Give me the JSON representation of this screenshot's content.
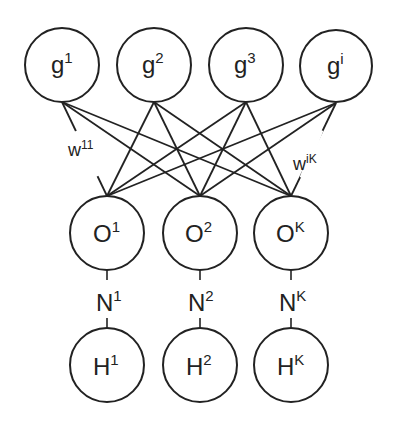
{
  "diagram": {
    "type": "network",
    "layers": {
      "g": [
        {
          "id": "g1",
          "base": "g",
          "sup": "1",
          "cx": 62,
          "cy": 65
        },
        {
          "id": "g2",
          "base": "g",
          "sup": "2",
          "cx": 154,
          "cy": 65
        },
        {
          "id": "g3",
          "base": "g",
          "sup": "3",
          "cx": 246,
          "cy": 65
        },
        {
          "id": "gi",
          "base": "g",
          "sup": "i",
          "cx": 336,
          "cy": 66
        }
      ],
      "O": [
        {
          "id": "O1",
          "base": "O",
          "sup": "1",
          "cx": 107,
          "cy": 233
        },
        {
          "id": "O2",
          "base": "O",
          "sup": "2",
          "cx": 200,
          "cy": 233
        },
        {
          "id": "OK",
          "base": "O",
          "sup": "K",
          "cx": 291,
          "cy": 233
        }
      ],
      "N": [
        {
          "id": "N1",
          "base": "N",
          "sup": "1"
        },
        {
          "id": "N2",
          "base": "N",
          "sup": "2"
        },
        {
          "id": "NK",
          "base": "N",
          "sup": "K"
        }
      ],
      "H": [
        {
          "id": "H1",
          "base": "H",
          "sup": "1",
          "cx": 107,
          "cy": 365
        },
        {
          "id": "H2",
          "base": "H",
          "sup": "2",
          "cx": 200,
          "cy": 365
        },
        {
          "id": "HK",
          "base": "H",
          "sup": "K",
          "cx": 291,
          "cy": 365
        }
      ]
    },
    "radius": 37,
    "edges": "fully connected g -> O",
    "weight_labels": [
      {
        "id": "w11",
        "base": "w",
        "sup": "11",
        "edge": "g1-O1"
      },
      {
        "id": "wiK",
        "base": "w",
        "sup": "iK",
        "edge": "gi-OK"
      }
    ],
    "line_color": "#222222"
  }
}
